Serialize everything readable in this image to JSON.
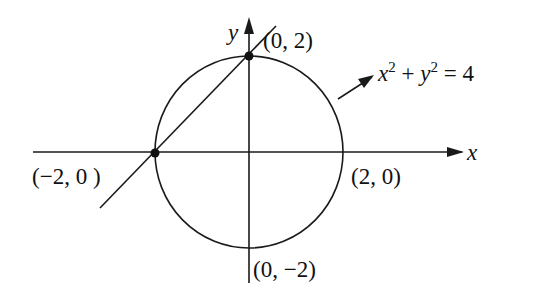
{
  "diagram": {
    "title": "",
    "colors": {
      "stroke": "#1a1a1a",
      "background": "#ffffff"
    },
    "axes": {
      "x_label": "x",
      "y_label": "y"
    },
    "circle": {
      "equation_x": "x",
      "equation_exp1": "2",
      "equation_plus": " + ",
      "equation_y": "y",
      "equation_exp2": "2",
      "equation_rhs": " = 4"
    },
    "points": {
      "top": "(0, 2)",
      "left": "(−2, 0 )",
      "right": "(2, 0)",
      "bottom": "(0, −2)"
    }
  }
}
